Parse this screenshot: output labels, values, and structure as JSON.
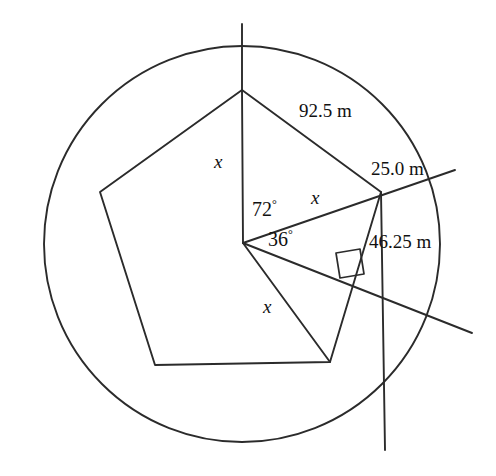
{
  "figure": {
    "stroke_color": "#2b2b2b",
    "background_color": "#ffffff",
    "text_color": "#111111",
    "circle": {
      "cx": 242,
      "cy": 244,
      "r": 198
    },
    "pentagon": {
      "vertices": [
        {
          "name": "top",
          "x": 242,
          "y": 90
        },
        {
          "name": "right",
          "x": 381,
          "y": 192
        },
        {
          "name": "bottom-right",
          "x": 330,
          "y": 362
        },
        {
          "name": "bottom-left",
          "x": 155,
          "y": 365
        },
        {
          "name": "left",
          "x": 100,
          "y": 192
        }
      ]
    },
    "center_point": {
      "x": 243,
      "y": 243
    },
    "labels": {
      "side_top": "92.5 m",
      "side_upper_right": "25.0 m",
      "side_lower_right": "46.25 m",
      "angle_large": "72",
      "angle_small": "36",
      "degree_symbol": "°",
      "radius_upper_left": "x",
      "radius_right": "x",
      "radius_lower": "x"
    },
    "markers": {
      "right_angle": "right-angle-square"
    },
    "transversals": [
      {
        "name": "apothem-extension",
        "from_x": 243,
        "from_y": 243,
        "to_x": 472,
        "to_y": 333
      },
      {
        "name": "radius-extension-upper",
        "from_x": 243,
        "from_y": 243,
        "to_x": 455,
        "to_y": 170
      },
      {
        "name": "side-extension-lower",
        "from_x": 381,
        "from_y": 192,
        "to_x": 385,
        "to_y": 450
      },
      {
        "name": "vertical-axis",
        "from_x": 242,
        "from_y": 24,
        "to_x": 242,
        "to_y": 90
      }
    ]
  }
}
